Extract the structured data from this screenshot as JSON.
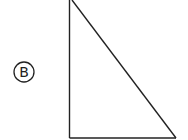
{
  "figure": {
    "option_label": "B",
    "shape": "right-triangle",
    "stroke_color": "#222222",
    "background": "#ffffff"
  }
}
